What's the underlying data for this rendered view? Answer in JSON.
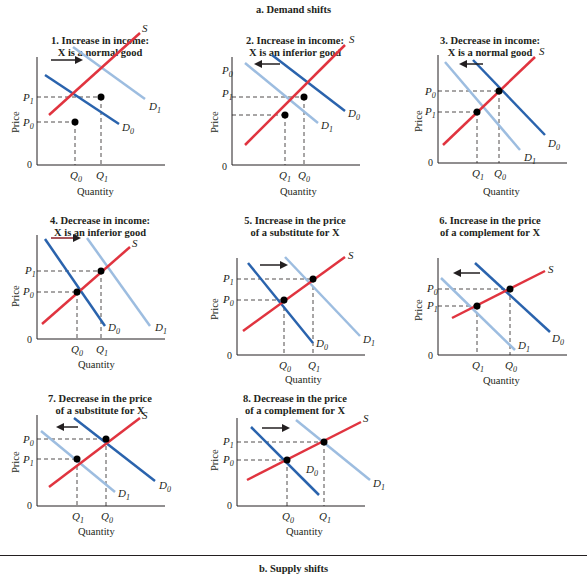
{
  "header": {
    "title": "a. Demand shifts"
  },
  "footer": {
    "title": "b. Supply shifts"
  },
  "colors": {
    "supply": "#e0343f",
    "demand_original": "#2a63ad",
    "demand_new": "#9dbde0",
    "axis": "#231f20",
    "arrow": "#231f20",
    "arrow_alt": "#8b1e24"
  },
  "axis_labels": {
    "x": "Quantity",
    "y": "Price",
    "origin": "0"
  },
  "panels": [
    {
      "id": 1,
      "title_line1": "1. Increase in income:",
      "title_line2": "X is a normal good",
      "shift": "right",
      "price_top": "P1",
      "price_bottom": "P0",
      "qty_left": "Q0",
      "qty_right": "Q1",
      "supply_label": "S",
      "d0_label": "D0",
      "d1_label": "D1"
    },
    {
      "id": 2,
      "title_line1": "2. Increase in income:",
      "title_line2": "X is an inferior good",
      "shift": "left",
      "price_top": "P0",
      "price_bottom": "P1",
      "qty_left": "Q1",
      "qty_right": "Q0",
      "supply_label": "S",
      "d0_label": "D0",
      "d1_label": "D1"
    },
    {
      "id": 3,
      "title_line1": "3. Decrease in income:",
      "title_line2": "X is a normal good",
      "shift": "left",
      "price_top": "P0",
      "price_bottom": "P1",
      "qty_left": "Q1",
      "qty_right": "Q0",
      "supply_label": "S",
      "d0_label": "D0",
      "d1_label": "D1"
    },
    {
      "id": 4,
      "title_line1": "4. Decrease in income:",
      "title_line2": "X is an inferior good",
      "shift": "right",
      "price_top": "P1",
      "price_bottom": "P0",
      "qty_left": "Q0",
      "qty_right": "Q1",
      "supply_label": "S",
      "d0_label": "D0",
      "d1_label": "D1"
    },
    {
      "id": 5,
      "title_line1": "5. Increase in the price",
      "title_line2": "of a substitute for X",
      "shift": "right",
      "price_top": "P1",
      "price_bottom": "P0",
      "qty_left": "Q0",
      "qty_right": "Q1",
      "supply_label": "S",
      "d0_label": "D0",
      "d1_label": "D1"
    },
    {
      "id": 6,
      "title_line1": "6. Increase in the price",
      "title_line2": "of a complement for X",
      "shift": "left",
      "price_top": "P0",
      "price_bottom": "P1",
      "qty_left": "Q1",
      "qty_right": "Q0",
      "supply_label": "S",
      "d0_label": "D0",
      "d1_label": "D1"
    },
    {
      "id": 7,
      "title_line1": "7. Decrease in the price",
      "title_line2": "of a substitute for X",
      "shift": "left",
      "price_top": "P0",
      "price_bottom": "P1",
      "qty_left": "Q1",
      "qty_right": "Q0",
      "supply_label": "S",
      "d0_label": "D0",
      "d1_label": "D1"
    },
    {
      "id": 8,
      "title_line1": "8. Decrease in the price",
      "title_line2": "of a complement for X",
      "shift": "right",
      "price_top": "P1",
      "price_bottom": "P0",
      "qty_left": "Q0",
      "qty_right": "Q1",
      "supply_label": "S",
      "d0_label": "D0",
      "d1_label": "D1"
    }
  ]
}
